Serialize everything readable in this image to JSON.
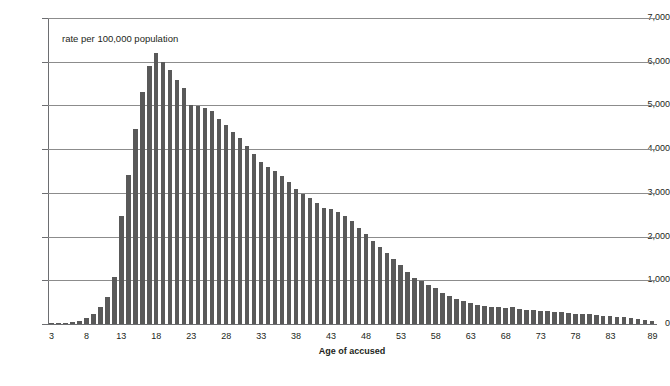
{
  "chart_data": {
    "type": "bar",
    "title": "",
    "xlabel": "Age of accused",
    "ylabel": "",
    "annotation": "rate per 100,000 population",
    "ylim": [
      0,
      7000
    ],
    "ytick_values": [
      0,
      1000,
      2000,
      3000,
      4000,
      5000,
      6000,
      7000
    ],
    "ytick_labels": [
      "0",
      "1,000",
      "2,000",
      "3,000",
      "4,000",
      "5,000",
      "6,000",
      "7,000"
    ],
    "grid": true,
    "legend": "none",
    "xtick_labels": [
      "3",
      "8",
      "13",
      "18",
      "23",
      "28",
      "33",
      "38",
      "43",
      "48",
      "53",
      "58",
      "63",
      "68",
      "73",
      "78",
      "83",
      "89"
    ],
    "xtick_ages": [
      3,
      8,
      13,
      18,
      23,
      28,
      33,
      38,
      43,
      48,
      53,
      58,
      63,
      68,
      73,
      78,
      83,
      89
    ],
    "bar_color": "#595959",
    "gridline_color": "#8c8c8c",
    "axis_color": "#6d6e71",
    "background_color": "#ffffff",
    "categories": [
      3,
      4,
      5,
      6,
      7,
      8,
      9,
      10,
      11,
      12,
      13,
      14,
      15,
      16,
      17,
      18,
      19,
      20,
      21,
      22,
      23,
      24,
      25,
      26,
      27,
      28,
      29,
      30,
      31,
      32,
      33,
      34,
      35,
      36,
      37,
      38,
      39,
      40,
      41,
      42,
      43,
      44,
      45,
      46,
      47,
      48,
      49,
      50,
      51,
      52,
      53,
      54,
      55,
      56,
      57,
      58,
      59,
      60,
      61,
      62,
      63,
      64,
      65,
      66,
      67,
      68,
      69,
      70,
      71,
      72,
      73,
      74,
      75,
      76,
      77,
      78,
      79,
      80,
      81,
      82,
      83,
      84,
      85,
      86,
      87,
      88,
      89
    ],
    "values": [
      10,
      15,
      25,
      45,
      75,
      130,
      230,
      390,
      620,
      1080,
      2480,
      3400,
      4450,
      5300,
      5900,
      6200,
      6000,
      5800,
      5580,
      5400,
      5000,
      4980,
      4950,
      4880,
      4700,
      4560,
      4400,
      4250,
      4080,
      3880,
      3700,
      3600,
      3500,
      3380,
      3260,
      3100,
      2980,
      2880,
      2760,
      2660,
      2620,
      2560,
      2480,
      2350,
      2200,
      2060,
      1900,
      1760,
      1620,
      1480,
      1360,
      1200,
      1060,
      980,
      900,
      820,
      720,
      640,
      580,
      520,
      480,
      440,
      420,
      400,
      380,
      360,
      400,
      340,
      330,
      320,
      300,
      290,
      280,
      270,
      250,
      240,
      230,
      220,
      200,
      190,
      180,
      160,
      150,
      130,
      110,
      90,
      60
    ]
  },
  "axis": {
    "x_title": "Age of accused"
  }
}
